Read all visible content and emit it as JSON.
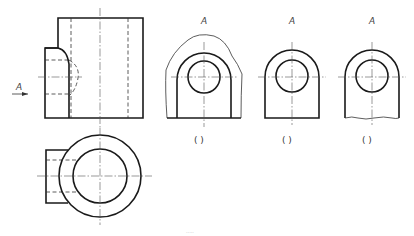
{
  "drawing": {
    "type": "orthographic-projection-exercise",
    "front_view": {
      "view_direction_label": "A"
    },
    "top_view": {},
    "options": [
      {
        "view_label": "A",
        "answer_brackets": "(    )",
        "variant": "broken-boundary-wavy-outline"
      },
      {
        "view_label": "A",
        "answer_brackets": "(    )",
        "variant": "full-view-straight-bottom"
      },
      {
        "view_label": "A",
        "answer_brackets": "(    )",
        "variant": "partial-view-wavy-break-line"
      }
    ],
    "watermark": "....."
  }
}
